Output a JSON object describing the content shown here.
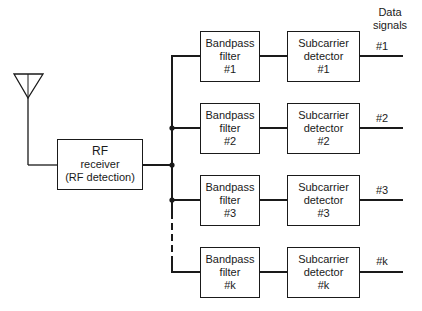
{
  "diagram": {
    "antenna": {
      "label": ""
    },
    "rf_receiver": {
      "line1": "RF",
      "line2": "receiver",
      "line3": "(RF detection)"
    },
    "output_header": {
      "line1": "Data",
      "line2": "signals"
    },
    "channels": [
      {
        "bandpass": {
          "line1": "Bandpass",
          "line2": "filter",
          "line3": "#1"
        },
        "detector": {
          "line1": "Subcarrier",
          "line2": "detector",
          "line3": "#1"
        },
        "output_label": "#1"
      },
      {
        "bandpass": {
          "line1": "Bandpass",
          "line2": "filter",
          "line3": "#2"
        },
        "detector": {
          "line1": "Subcarrier",
          "line2": "detector",
          "line3": "#2"
        },
        "output_label": "#2"
      },
      {
        "bandpass": {
          "line1": "Bandpass",
          "line2": "filter",
          "line3": "#3"
        },
        "detector": {
          "line1": "Subcarrier",
          "line2": "detector",
          "line3": "#3"
        },
        "output_label": "#3"
      },
      {
        "bandpass": {
          "line1": "Bandpass",
          "line2": "filter",
          "line3": "#k"
        },
        "detector": {
          "line1": "Subcarrier",
          "line2": "detector",
          "line3": "#k"
        },
        "output_label": "#k"
      }
    ],
    "colors": {
      "line": "#1a1a1a",
      "background": "#ffffff"
    }
  }
}
